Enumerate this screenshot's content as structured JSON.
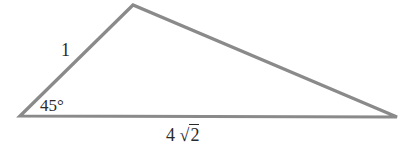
{
  "figure": {
    "type": "triangle",
    "stroke_color": "#8a8a8a",
    "vertices": {
      "left": [
        20,
        116
      ],
      "top": [
        133,
        5
      ],
      "right": [
        397,
        117
      ]
    },
    "labels": {
      "left_side": "1",
      "left_angle": "45°",
      "base_coefficient": "4",
      "base_radical": "√",
      "base_radicand": "2"
    }
  }
}
